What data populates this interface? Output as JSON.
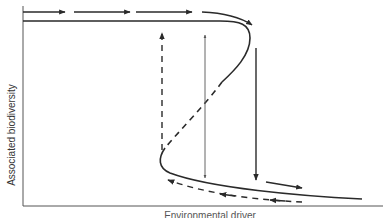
{
  "diagram": {
    "type": "hysteresis-fold-bifurcation",
    "ylabel": "Associated biodiversity",
    "xlabel": "Environmental driver",
    "colors": {
      "line": "#2a2a2a",
      "thin_line": "#555555",
      "axis": "#555555",
      "background": "#ffffff"
    },
    "elements": [
      {
        "name": "upper-stable-branch",
        "style": "solid"
      },
      {
        "name": "unstable-middle-branch",
        "style": "dashed"
      },
      {
        "name": "lower-stable-branch",
        "style": "solid"
      },
      {
        "name": "top-forward-arrows",
        "count": 4,
        "direction": "right"
      },
      {
        "name": "collapse-arrow",
        "style": "solid",
        "direction": "down"
      },
      {
        "name": "recovery-arrow",
        "style": "dashed",
        "direction": "up"
      },
      {
        "name": "thin-double-arrow",
        "style": "thin",
        "direction": "up-and-down"
      },
      {
        "name": "bottom-return-arrows",
        "style": "dashed",
        "direction": "left"
      },
      {
        "name": "bottom-forward-arrow",
        "direction": "right"
      }
    ]
  }
}
